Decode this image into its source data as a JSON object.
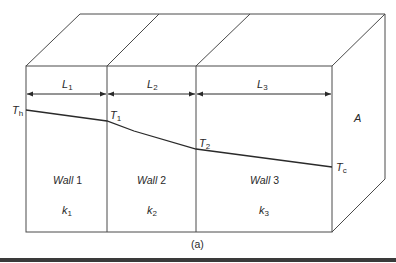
{
  "figure": {
    "caption": "(a)",
    "area_label": "A",
    "walls": [
      {
        "name_italic": "Wall",
        "name_num": "1",
        "k_main": "k",
        "k_sub": "1",
        "length_main": "L",
        "length_sub": "1"
      },
      {
        "name_italic": "Wall",
        "name_num": "2",
        "k_main": "k",
        "k_sub": "2",
        "length_main": "L",
        "length_sub": "2"
      },
      {
        "name_italic": "Wall",
        "name_num": "3",
        "k_main": "k",
        "k_sub": "3",
        "length_main": "L",
        "length_sub": "3"
      }
    ],
    "temperatures": [
      {
        "main": "T",
        "sub": "h"
      },
      {
        "main": "T",
        "sub": "1"
      },
      {
        "main": "T",
        "sub": "2"
      },
      {
        "main": "T",
        "sub": "c"
      }
    ]
  },
  "colors": {
    "line": "#4a4a4a",
    "text": "#2a2a2a",
    "background": "#ffffff"
  }
}
